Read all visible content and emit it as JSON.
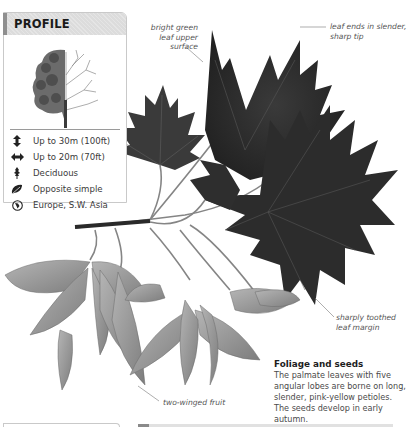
{
  "profile": {
    "title": "PROFILE",
    "image": "tree-silhouette-half-leafed",
    "items": [
      {
        "icon": "height-arrow-icon",
        "label": "Up to 30m (100ft)"
      },
      {
        "icon": "width-arrow-icon",
        "label": "Up to 20m (70ft)"
      },
      {
        "icon": "deciduous-leaf-icon",
        "label": "Deciduous"
      },
      {
        "icon": "leaf-arrangement-icon",
        "label": "Opposite simple"
      },
      {
        "icon": "globe-icon",
        "label": "Europe, S.W. Asia"
      }
    ]
  },
  "illustration": {
    "subject": "maple leaves and winged seeds",
    "colors": {
      "leaf_dark": "#2b2b2b",
      "leaf_mid": "#4a4a4a",
      "seed": "#9a9a9a",
      "stem": "#7a7a7a"
    }
  },
  "callouts": {
    "bright_green": "bright green leaf upper surface",
    "bright_green_lines": [
      "bright green",
      "leaf upper",
      "surface"
    ],
    "leaf_tip_lines": [
      "leaf ends in slender,",
      "sharp tip"
    ],
    "leaf_margin_lines": [
      "sharply toothed",
      "leaf margin"
    ],
    "fruit": "two-winged fruit"
  },
  "caption": {
    "title": "Foliage and seeds",
    "body": "The palmate leaves with five angular lobes are borne on long, slender, pink-yellow petioles. The seeds develop in early autumn."
  },
  "colors": {
    "panel_border": "#c9c9c9",
    "panel_header": "#dcdcdc",
    "panel_accent": "#8f8f8f",
    "text": "#3a3a3a"
  }
}
